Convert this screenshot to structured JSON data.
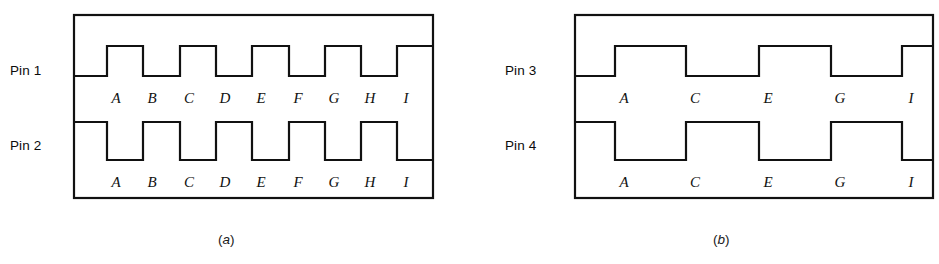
{
  "figure": {
    "panels": [
      {
        "id": "panel-a",
        "caption_open": "(",
        "caption_letter": "a",
        "caption_close": ")",
        "box": {
          "x": 74,
          "y": 15,
          "width": 359,
          "height": 183
        },
        "traces": [
          {
            "name": "Pin 1",
            "label": "Pin 1",
            "label_x": 10,
            "label_y": 63,
            "baseline_y": 76,
            "top_y": 46,
            "start_level": "low",
            "cycles": 5,
            "transitions_px": [
              107,
              143,
              180,
              216,
              252,
              289,
              325,
              361,
              397
            ],
            "event_labels": [
              "A",
              "B",
              "C",
              "D",
              "E",
              "F",
              "G",
              "H",
              "I"
            ],
            "event_label_y": 103
          },
          {
            "name": "Pin 2",
            "label": "Pin 2",
            "label_x": 10,
            "label_y": 138,
            "baseline_y": 160,
            "top_y": 122,
            "start_level": "high",
            "cycles": 5,
            "transitions_px": [
              107,
              143,
              180,
              216,
              252,
              289,
              325,
              361,
              397
            ],
            "event_labels": [
              "A",
              "B",
              "C",
              "D",
              "E",
              "F",
              "G",
              "H",
              "I"
            ],
            "event_label_y": 187
          }
        ]
      },
      {
        "id": "panel-b",
        "caption_open": "(",
        "caption_letter": "b",
        "caption_close": ")",
        "box": {
          "x": 105,
          "y": 15,
          "width": 358,
          "height": 183
        },
        "traces": [
          {
            "name": "Pin 3",
            "label": "Pin 3",
            "label_x": 35,
            "label_y": 63,
            "baseline_y": 76,
            "top_y": 46,
            "start_level": "low",
            "cycles": 3,
            "transitions_px": [
              145,
              216,
              289,
              361,
              432
            ],
            "event_labels": [
              "A",
              "C",
              "E",
              "G",
              "I"
            ],
            "event_label_y": 103
          },
          {
            "name": "Pin 4",
            "label": "Pin 4",
            "label_x": 35,
            "label_y": 138,
            "baseline_y": 160,
            "top_y": 122,
            "start_level": "high",
            "cycles": 3,
            "transitions_px": [
              145,
              216,
              289,
              361,
              432
            ],
            "event_labels": [
              "A",
              "C",
              "E",
              "G",
              "I"
            ],
            "event_label_y": 187
          }
        ]
      }
    ],
    "caption_y": 232,
    "caption_a_x": 218,
    "caption_b_x": 713,
    "stroke_color": "#111111",
    "stroke_width": 2.2,
    "background_color": "#ffffff"
  }
}
